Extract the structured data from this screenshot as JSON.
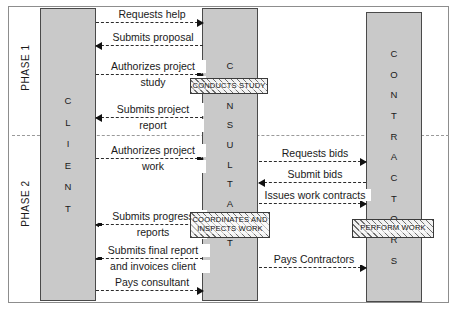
{
  "diagram": {
    "colors": {
      "column_fill": "#c9c9c9",
      "column_border": "#4a4a4a",
      "arrow": "#2b2b2b",
      "frame": "#8d8d8d",
      "activity_hatch": "#6f6f6f"
    }
  },
  "phases": [
    {
      "key": "phase1",
      "label": "PHASE 1"
    },
    {
      "key": "phase2",
      "label": "PHASE 2"
    }
  ],
  "columns": [
    {
      "key": "client",
      "name": "CLIENT",
      "letters": [
        "C",
        "L",
        "I",
        "E",
        "N",
        "T"
      ]
    },
    {
      "key": "consultant",
      "name": "CONSULTANT",
      "letters": [
        "C",
        "O",
        "N",
        "S",
        "U",
        "L",
        "T",
        "A",
        "N",
        "T"
      ]
    },
    {
      "key": "contractors",
      "name": "CONTRACTORS",
      "letters": [
        "C",
        "O",
        "N",
        "T",
        "R",
        "A",
        "C",
        "T",
        "O",
        "R",
        "S"
      ]
    }
  ],
  "activities": [
    {
      "key": "conducts_study",
      "label": "CONDUCTS STUDY",
      "actor": "consultant",
      "phase": "phase1"
    },
    {
      "key": "coordinates",
      "label": "COORDINATES AND INSPECTS WORK",
      "actor": "consultant",
      "phase": "phase2"
    },
    {
      "key": "perform_work",
      "label": "PERFORM WORK",
      "actor": "contractors",
      "phase": "phase2"
    }
  ],
  "messages": [
    {
      "key": "requests_help",
      "label": "Requests help",
      "from": "client",
      "to": "consultant",
      "direction": "right",
      "phase": "phase1"
    },
    {
      "key": "submits_proposal",
      "label": "Submits proposal",
      "from": "consultant",
      "to": "client",
      "direction": "left",
      "phase": "phase1"
    },
    {
      "key": "authorizes_study",
      "label": "Authorizes project study",
      "from": "client",
      "to": "consultant",
      "direction": "right",
      "phase": "phase1",
      "line1": "Authorizes project",
      "line2": "study"
    },
    {
      "key": "submits_report",
      "label": "Submits project report",
      "from": "consultant",
      "to": "client",
      "direction": "left",
      "phase": "phase1",
      "line1": "Submits project",
      "line2": "report"
    },
    {
      "key": "authorizes_work",
      "label": "Authorizes project work",
      "from": "client",
      "to": "consultant",
      "direction": "right",
      "phase": "phase2",
      "line1": "Authorizes project",
      "line2": "work"
    },
    {
      "key": "requests_bids",
      "label": "Requests bids",
      "from": "consultant",
      "to": "contractors",
      "direction": "right",
      "phase": "phase2"
    },
    {
      "key": "submit_bids",
      "label": "Submit bids",
      "from": "contractors",
      "to": "consultant",
      "direction": "left",
      "phase": "phase2"
    },
    {
      "key": "issues_contracts",
      "label": "Issues work contracts",
      "from": "consultant",
      "to": "contractors",
      "direction": "right",
      "phase": "phase2"
    },
    {
      "key": "submits_progress",
      "label": "Submits progress reports",
      "from": "consultant",
      "to": "client",
      "direction": "left",
      "phase": "phase2",
      "line1": "Submits progress",
      "line2": "reports"
    },
    {
      "key": "pays_contractors",
      "label": "Pays Contractors",
      "from": "consultant",
      "to": "contractors",
      "direction": "right",
      "phase": "phase2"
    },
    {
      "key": "submits_final_report",
      "label": "Submits final report and invoices client",
      "from": "consultant",
      "to": "client",
      "direction": "left",
      "phase": "phase2",
      "line1": "Submits final report",
      "line2": "and invoices client"
    },
    {
      "key": "pays_consultant",
      "label": "Pays consultant",
      "from": "client",
      "to": "consultant",
      "direction": "right",
      "phase": "phase2"
    }
  ]
}
